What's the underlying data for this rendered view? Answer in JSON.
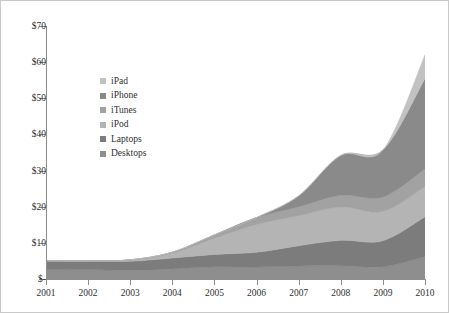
{
  "chart_data": {
    "type": "area",
    "stacked": true,
    "title": "",
    "xlabel": "",
    "ylabel": "",
    "grid": false,
    "legend_position": "inside-top-left",
    "x": [
      2001,
      2002,
      2003,
      2004,
      2005,
      2006,
      2007,
      2008,
      2009,
      2010
    ],
    "categories": [
      "2001",
      "2002",
      "2003",
      "2004",
      "2005",
      "2006",
      "2007",
      "2008",
      "2009",
      "2010"
    ],
    "xlim": [
      2001,
      2010
    ],
    "ylim": [
      0,
      70
    ],
    "y_ticks": [
      0,
      10,
      20,
      30,
      40,
      50,
      60,
      70
    ],
    "y_tick_labels": [
      "$-",
      "$10",
      "$20",
      "$30",
      "$40",
      "$50",
      "$60",
      "$70"
    ],
    "value_prefix": "$",
    "series": [
      {
        "name": "Desktops",
        "color": "#8e8e8e",
        "values": [
          2.6,
          2.6,
          2.4,
          2.8,
          3.4,
          3.3,
          3.6,
          3.7,
          3.4,
          6.2
        ]
      },
      {
        "name": "Laptops",
        "color": "#7c7c7c",
        "values": [
          2.4,
          2.3,
          2.5,
          3.0,
          3.4,
          4.1,
          5.6,
          7.0,
          7.2,
          11.0
        ]
      },
      {
        "name": "iPod",
        "color": "#b4b4b4",
        "values": [
          0.0,
          0.1,
          0.3,
          1.3,
          4.5,
          7.7,
          8.3,
          9.2,
          8.1,
          8.3
        ]
      },
      {
        "name": "iTunes",
        "color": "#a2a2a2",
        "values": [
          0.0,
          0.0,
          0.1,
          0.3,
          0.9,
          1.9,
          2.5,
          3.3,
          4.0,
          5.0
        ]
      },
      {
        "name": "iPhone",
        "color": "#8a8a8a",
        "values": [
          0.0,
          0.0,
          0.0,
          0.0,
          0.0,
          0.0,
          3.0,
          11.0,
          13.0,
          25.0
        ]
      },
      {
        "name": "iPad",
        "color": "#c2c2c2",
        "values": [
          0.0,
          0.0,
          0.0,
          0.0,
          0.0,
          0.0,
          0.0,
          0.0,
          0.0,
          6.5
        ]
      }
    ],
    "legend_order_top_to_bottom": [
      "iPad",
      "iPhone",
      "iTunes",
      "iPod",
      "Laptops",
      "Desktops"
    ],
    "totals": [
      5.0,
      5.0,
      5.3,
      7.4,
      12.2,
      17.0,
      23.0,
      34.2,
      35.7,
      62.0
    ]
  },
  "legend": {
    "items": [
      {
        "label": "iPad",
        "color": "#c2c2c2"
      },
      {
        "label": "iPhone",
        "color": "#8a8a8a"
      },
      {
        "label": "iTunes",
        "color": "#a2a2a2"
      },
      {
        "label": "iPod",
        "color": "#b4b4b4"
      },
      {
        "label": "Laptops",
        "color": "#7c7c7c"
      },
      {
        "label": "Desktops",
        "color": "#8e8e8e"
      }
    ]
  },
  "axes": {
    "y_labels": [
      "$70",
      "$60",
      "$50",
      "$40",
      "$30",
      "$20",
      "$10",
      "$-"
    ],
    "x_labels": [
      "2001",
      "2002",
      "2003",
      "2004",
      "2005",
      "2006",
      "2007",
      "2008",
      "2009",
      "2010"
    ]
  }
}
